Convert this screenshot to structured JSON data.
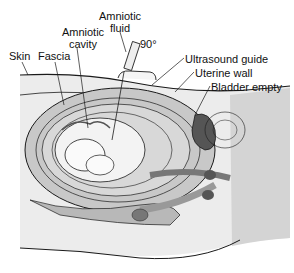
{
  "diagram": {
    "labels": {
      "skin": "Skin",
      "fascia": "Fascia",
      "amniotic_cavity_1": "Amniotic",
      "amniotic_cavity_2": "cavity",
      "amniotic_fluid_1": "Amniotic",
      "amniotic_fluid_2": "fluid",
      "angle": "90°",
      "ultrasound_guide": "Ultrasound guide",
      "uterine_wall": "Uterine wall",
      "bladder_empty": "Bladder empty"
    },
    "colors": {
      "background": "#ffffff",
      "tissue_light": "#ececec",
      "tissue_mid": "#c8c8c8",
      "tissue_dark": "#8a8a8a",
      "bladder": "#555555",
      "outline": "#1a1a1a"
    }
  }
}
